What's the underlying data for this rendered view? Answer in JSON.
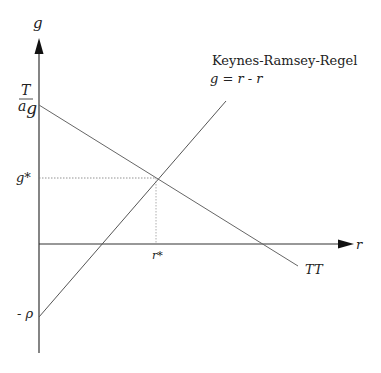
{
  "diagram": {
    "y_axis_label": "g",
    "x_axis_label": "r",
    "y_intercept_tt_numerator": "T",
    "y_intercept_tt_denominator": "a",
    "y_intercept_tt_sub": "g",
    "g_star_label": "g*",
    "r_star_label": "r*",
    "minus_rho_label": "- ρ",
    "keynes_title": "Keynes-Ramsey-Regel",
    "keynes_equation": "g = r - r",
    "tt_label": "TT",
    "colors": {
      "axis": "#333333",
      "curve": "#555555",
      "guide": "#777777"
    }
  }
}
